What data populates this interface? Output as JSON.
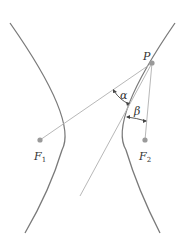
{
  "diagram": {
    "points": {
      "P": {
        "label": "P",
        "x": 152,
        "y": 63
      },
      "F1": {
        "label": "F",
        "sub": "1",
        "x": 40,
        "y": 140
      },
      "F2": {
        "label": "F",
        "sub": "2",
        "x": 145,
        "y": 140
      }
    },
    "angles": {
      "alpha": {
        "label": "α"
      },
      "beta": {
        "label": "β"
      }
    },
    "colors": {
      "curve": "#7a7a7a",
      "line": "#b8b8b8",
      "point": "#9a9a9a",
      "text": "#333333"
    }
  }
}
